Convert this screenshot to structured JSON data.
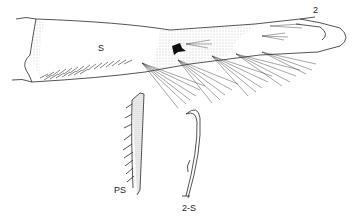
{
  "figure": {
    "labels": {
      "siphon": "S",
      "seta_number": "2",
      "pecten_spine": "PS",
      "seta_detail": "2-S"
    },
    "colors": {
      "ink": "#2a2a2a",
      "stipple": "#9a9a9a",
      "background": "#ffffff"
    }
  }
}
